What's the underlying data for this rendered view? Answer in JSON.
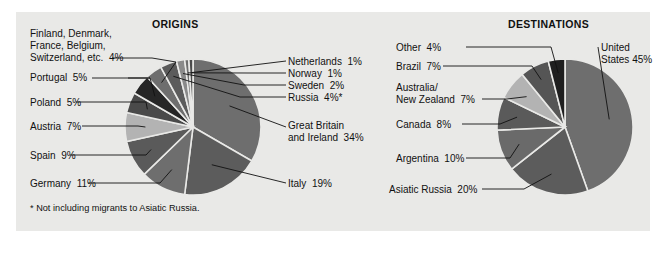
{
  "figure": {
    "background_color": "#ffffff",
    "panel_color": "#e9e9e7",
    "footnote": "* Not including migrants to Asiatic Russia."
  },
  "charts": {
    "origins": {
      "title": "ORIGINS",
      "labels": {
        "netherlands": "Netherlands  1%",
        "norway": "Norway  1%",
        "sweden": "Sweden  2%",
        "russia": "Russia  4%*",
        "great_britain_1": "Great Britain",
        "great_britain_2": "and Ireland  34%",
        "italy": "Italy  19%",
        "germany": "Germany  11%",
        "spain": "Spain  9%",
        "austria": "Austria  7%",
        "poland": "Poland  5%",
        "portugal": "Portugal  5%",
        "misc_1": "Finland, Denmark,",
        "misc_2": "France, Belgium,",
        "misc_3": "Switzerland, etc.  4%"
      }
    },
    "destinations": {
      "title": "DESTINATIONS",
      "labels": {
        "other": "Other  4%",
        "brazil": "Brazil  7%",
        "australia_1": "Australia/",
        "australia_2": "New Zealand  7%",
        "canada": "Canada  8%",
        "argentina": "Argentina  10%",
        "asiatic_russia": "Asiatic Russia  20%",
        "united_states_1": "United",
        "united_states_2": "States 45%"
      }
    }
  },
  "chart_data": [
    {
      "type": "pie",
      "title": "ORIGINS",
      "id": "origins",
      "start_angle_deg": 0,
      "direction": "clockwise",
      "center": [
        193,
        127
      ],
      "radius": 68,
      "footnote": "* Not including migrants to Asiatic Russia.",
      "categories": [
        "Great Britain and Ireland",
        "Italy",
        "Germany",
        "Spain",
        "Austria",
        "Poland",
        "Portugal",
        "Finland, Denmark, France, Belgium, Switzerland, etc.",
        "Russia",
        "Sweden",
        "Norway",
        "Netherlands"
      ],
      "values": [
        34,
        19,
        11,
        9,
        7,
        5,
        5,
        4,
        4,
        2,
        1,
        1
      ],
      "value_labels": [
        "34%",
        "19%",
        "11%",
        "9%",
        "7%",
        "5%",
        "5%",
        "4%",
        "4%*",
        "2%",
        "1%",
        "1%"
      ],
      "colors": [
        "#6e6e6e",
        "#5c5c5c",
        "#6e6e6e",
        "#5a5a5a",
        "#b3b3b3",
        "#4a4a4a",
        "#262626",
        "#6e6e6e",
        "#5c5c5c",
        "#8a8a8a",
        "#6e6e6e",
        "#4a4a4a"
      ],
      "unit": "percent"
    },
    {
      "type": "pie",
      "title": "DESTINATIONS",
      "id": "destinations",
      "start_angle_deg": 0,
      "direction": "clockwise",
      "center": [
        565,
        127
      ],
      "radius": 68,
      "categories": [
        "United States",
        "Asiatic Russia",
        "Argentina",
        "Canada",
        "Australia/New Zealand",
        "Brazil",
        "Other"
      ],
      "values": [
        45,
        20,
        10,
        8,
        7,
        7,
        4
      ],
      "value_labels": [
        "45%",
        "20%",
        "10%",
        "8%",
        "7%",
        "7%",
        "4%"
      ],
      "colors": [
        "#6e6e6e",
        "#5c5c5c",
        "#6a6a6a",
        "#5a5a5a",
        "#b3b3b3",
        "#555555",
        "#1f1f1f"
      ],
      "unit": "percent"
    }
  ]
}
